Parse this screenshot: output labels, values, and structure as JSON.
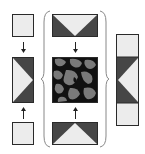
{
  "diagram": {
    "colors": {
      "light": "#ececec",
      "dark": "#464646",
      "border": "#2a2a2a",
      "texture_dark": "#111111",
      "texture_light": "#7a7a7a",
      "arrow": "#222222",
      "brace": "#888888"
    },
    "left_column": {
      "top_patch": "plain-light-square",
      "middle_patch": "right-pointing-triangle-light-on-dark",
      "bottom_patch": "plain-light-square",
      "arrows": [
        "down",
        "up"
      ]
    },
    "middle_column": {
      "top_patch": "downward-triangle-light-on-dark",
      "middle_patch": "noise-texture",
      "bottom_patch": "upward-triangle-light-on-dark",
      "arrows": [
        "down",
        "up"
      ],
      "grouping": "curly-braces"
    },
    "right_column": {
      "segments": [
        "plain-light",
        "left-pointing-triangle-light-on-dark",
        "plain-light"
      ]
    }
  }
}
